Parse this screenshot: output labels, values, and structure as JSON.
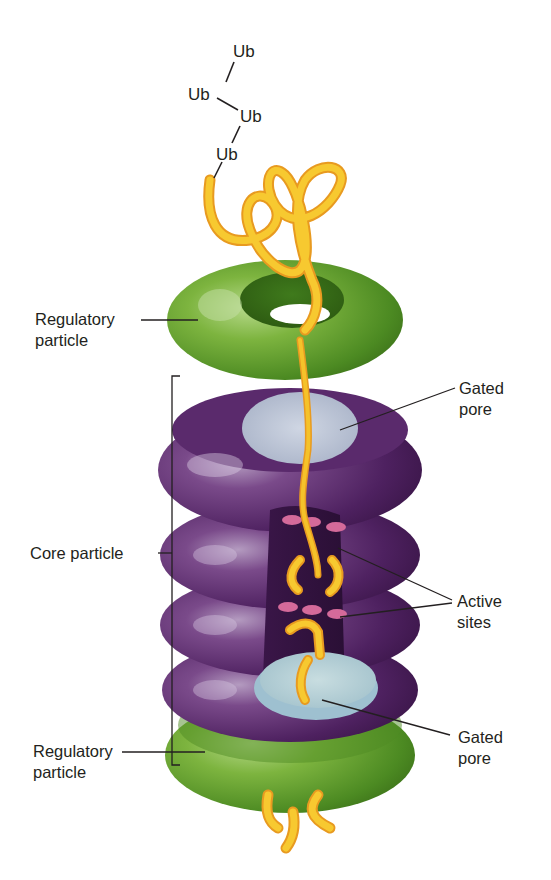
{
  "diagram": {
    "ubiquitin_chain": [
      "Ub",
      "Ub",
      "Ub",
      "Ub"
    ],
    "labels": {
      "regulatory_top": {
        "line1": "Regulatory",
        "line2": "particle"
      },
      "gated_pore_top": {
        "line1": "Gated",
        "line2": "pore"
      },
      "core_particle": "Core particle",
      "active_sites": {
        "line1": "Active",
        "line2": "sites"
      },
      "regulatory_bottom": {
        "line1": "Regulatory",
        "line2": "particle"
      },
      "gated_pore_bottom": {
        "line1": "Gated",
        "line2": "pore"
      }
    },
    "colors": {
      "regulatory_green": "#5a9a2a",
      "regulatory_green_light": "#9cc86a",
      "core_purple": "#4a1f57",
      "core_purple_light": "#8a5f9a",
      "pore_blue": "#b8c8d6",
      "polypeptide_yellow": "#f5c22a",
      "polypeptide_outline": "#e89a20",
      "active_site_pink": "#d46a9a",
      "label_text": "#231f20"
    }
  }
}
